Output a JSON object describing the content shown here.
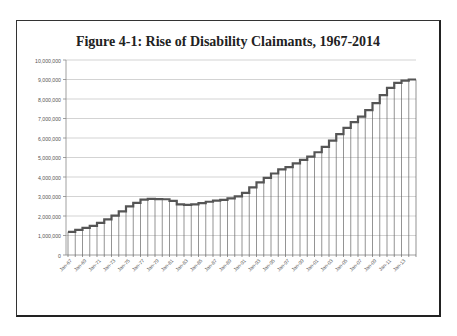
{
  "chart_data": {
    "type": "bar",
    "title": "Figure 4-1: Rise of Disability Claimants, 1967-2014",
    "xlabel": "",
    "ylabel": "",
    "ylim": [
      0,
      10000000
    ],
    "yticks": [
      "0",
      "1,000,000",
      "2,000,000",
      "3,000,000",
      "4,000,000",
      "5,000,000",
      "6,000,000",
      "7,000,000",
      "8,000,000",
      "9,000,000",
      "10,000,000"
    ],
    "grid": true,
    "legend": "none",
    "x_tick_labels": [
      "Jan-67",
      "Jan-69",
      "Jan-71",
      "Jan-73",
      "Jan-75",
      "Jan-77",
      "Jan-79",
      "Jan-81",
      "Jan-83",
      "Jan-85",
      "Jan-87",
      "Jan-89",
      "Jan-91",
      "Jan-93",
      "Jan-95",
      "Jan-97",
      "Jan-99",
      "Jan-01",
      "Jan-03",
      "Jan-05",
      "Jan-07",
      "Jan-09",
      "Jan-11",
      "Jan-13"
    ],
    "categories": [
      "1967",
      "1968",
      "1969",
      "1970",
      "1971",
      "1972",
      "1973",
      "1974",
      "1975",
      "1976",
      "1977",
      "1978",
      "1979",
      "1980",
      "1981",
      "1982",
      "1983",
      "1984",
      "1985",
      "1986",
      "1987",
      "1988",
      "1989",
      "1990",
      "1991",
      "1992",
      "1993",
      "1994",
      "1995",
      "1996",
      "1997",
      "1998",
      "1999",
      "2000",
      "2001",
      "2002",
      "2003",
      "2004",
      "2005",
      "2006",
      "2007",
      "2008",
      "2009",
      "2010",
      "2011",
      "2012",
      "2013",
      "2014"
    ],
    "values": [
      1190000,
      1290000,
      1390000,
      1490000,
      1650000,
      1830000,
      2020000,
      2240000,
      2490000,
      2670000,
      2840000,
      2880000,
      2870000,
      2860000,
      2780000,
      2600000,
      2570000,
      2600000,
      2660000,
      2730000,
      2790000,
      2830000,
      2900000,
      3010000,
      3190000,
      3470000,
      3720000,
      3960000,
      4180000,
      4390000,
      4510000,
      4700000,
      4880000,
      5040000,
      5270000,
      5540000,
      5870000,
      6200000,
      6520000,
      6810000,
      7100000,
      7430000,
      7790000,
      8200000,
      8570000,
      8830000,
      8940000,
      9000000
    ],
    "series_style": {
      "line_color": "#555555",
      "drop_line_color": "#666666"
    }
  }
}
